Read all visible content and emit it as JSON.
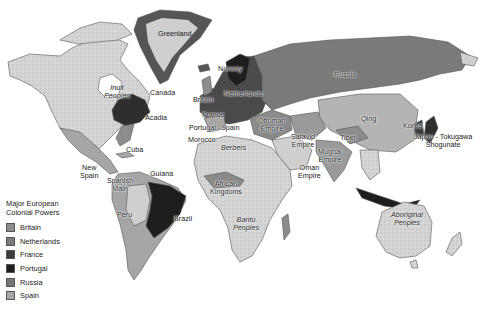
{
  "map": {
    "legend": {
      "title_line1": "Major European",
      "title_line2": "Colonial Powers",
      "items": [
        {
          "label": "Britain",
          "color": "#8c8c8c"
        },
        {
          "label": "Netherlands",
          "color": "#7a7a7a"
        },
        {
          "label": "France",
          "color": "#3c3c3c"
        },
        {
          "label": "Portugal",
          "color": "#1e1e1e"
        },
        {
          "label": "Russia",
          "color": "#767676"
        },
        {
          "label": "Spain",
          "color": "#a6a6a6"
        }
      ]
    },
    "labels": {
      "greenland": "Greenland",
      "inuit_1": "Inuit",
      "inuit_2": "Peoples",
      "canada": "Canada",
      "acadia": "Acadia",
      "norway": "Norway",
      "britain": "Britain",
      "netherlands": "Netherlands",
      "france": "France",
      "portugal": "Portugal",
      "spain": "Spain",
      "morocco": "Morocco",
      "ottoman_1": "Ottoman",
      "ottoman_2": "Empire",
      "russia": "Russia",
      "safavid_1": "Safavid",
      "safavid_2": "Empire",
      "qing": "Qing",
      "tibet": "Tibet",
      "korea": "Korea",
      "japan_1": "Japan - Tokugawa",
      "japan_2": "Shogunate",
      "mughal_1": "Mughal",
      "mughal_2": "Empire",
      "oman_1": "Oman",
      "oman_2": "Empire",
      "berbers": "Berbers",
      "african_1": "African",
      "african_2": "Kingdoms",
      "bantu_1": "Bantu",
      "bantu_2": "Peoples",
      "cuba": "Cuba",
      "new_spain_1": "New",
      "new_spain_2": "Spain",
      "spanish_main_1": "Spanish",
      "spanish_main_2": "Main",
      "guiana": "Guiana",
      "peru": "Peru",
      "brazil": "Brazil",
      "aboriginal_1": "Aboriginal",
      "aboriginal_2": "Peoples"
    }
  }
}
